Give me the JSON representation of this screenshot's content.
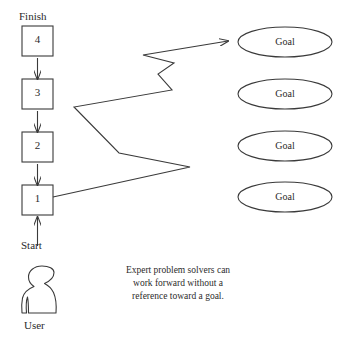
{
  "diagram": {
    "endpoints": {
      "finish_label": "Finish",
      "start_label": "Start",
      "user_label": "User"
    },
    "steps": [
      {
        "label": "4",
        "x": 22,
        "y": 26
      },
      {
        "label": "3",
        "x": 22,
        "y": 79
      },
      {
        "label": "2",
        "x": 22,
        "y": 132
      },
      {
        "label": "1",
        "x": 22,
        "y": 185
      }
    ],
    "goals": [
      {
        "label": "Goal",
        "cy": 42
      },
      {
        "label": "Goal",
        "cy": 94
      },
      {
        "label": "Goal",
        "cy": 146
      },
      {
        "label": "Goal",
        "cy": 197
      }
    ],
    "caption": {
      "line1": "Expert problem solvers can",
      "line2": "work forward without a",
      "line3": "reference toward a goal."
    },
    "icons": {
      "user": "user-silhouette-icon",
      "zigzag_arrow": "zigzag-arrow-icon",
      "up_arrow": "up-arrow-icon"
    },
    "colors": {
      "stroke": "#3a3a3a",
      "text": "#2b2b2b",
      "background": "#ffffff"
    }
  }
}
